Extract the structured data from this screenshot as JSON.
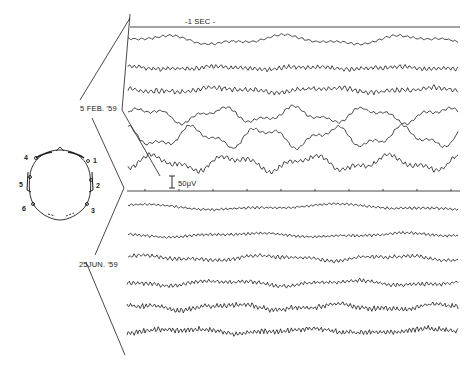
{
  "figure": {
    "timing_label": "-1 SEC -",
    "scale_bar_label": "50μV",
    "groups": [
      {
        "date_label": "5 FEB. '59",
        "channels": 6
      },
      {
        "date_label": "25JUN. '59",
        "channels": 6
      }
    ],
    "head_diagram": {
      "electrodes": [
        "1",
        "2",
        "3",
        "4",
        "5",
        "6"
      ]
    }
  },
  "colors": {
    "ink": "#1a1a1a",
    "paper": "#ffffff"
  }
}
